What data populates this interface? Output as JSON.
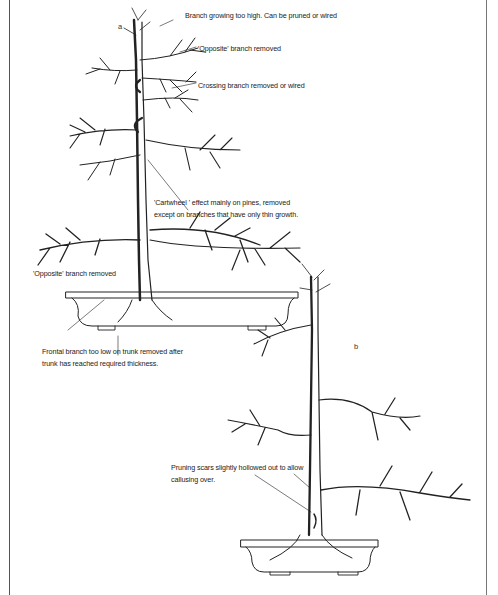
{
  "figure_a": {
    "label": "a",
    "annotations": {
      "branch_too_high": "Branch growing too high. Can be pruned or wired",
      "opposite_removed_top": "'Opposite' branch removed",
      "crossing_removed": "Crossing branch removed or wired",
      "cartwheel_line1": "'Cartwheel ' effect mainly on pines, removed",
      "cartwheel_line2": "except on branches that have only thin growth.",
      "opposite_removed_low": "'Opposite' branch removed",
      "frontal_line1": "Frontal branch too low on trunk removed after",
      "frontal_line2": "trunk has reached required thickness."
    }
  },
  "figure_b": {
    "label": "b",
    "annotations": {
      "pruning_line1": "Pruning scars slightly hollowed out to allow",
      "pruning_line2": "callusing over."
    }
  },
  "colors": {
    "ink": "#222222",
    "frame": "#555555",
    "background": "#ffffff"
  }
}
